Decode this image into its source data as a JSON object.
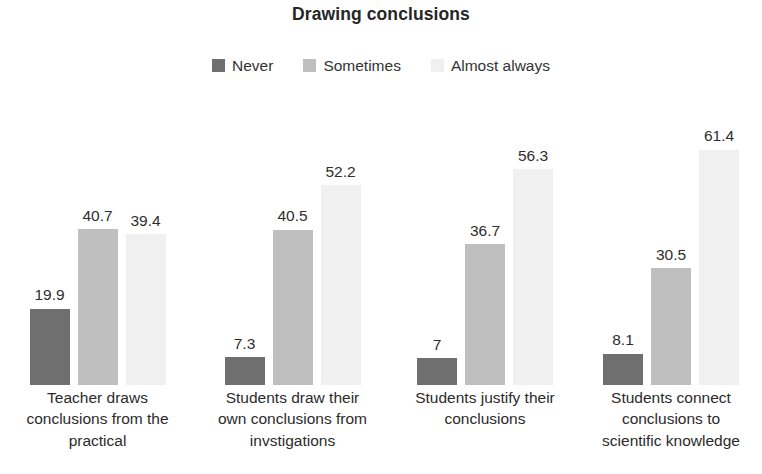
{
  "chart_data": {
    "type": "bar",
    "title": "Drawing conclusions",
    "xlabel": "",
    "ylabel": "",
    "ylim": [
      0,
      70
    ],
    "grid": false,
    "legend_position": "top-center",
    "categories": [
      "Teacher draws conclusions from the practical",
      "Students draw their own conclusions from invstigations",
      "Students justify their conclusions",
      "Students connect conclusions to scientific knowledge"
    ],
    "category_lines": [
      [
        "Teacher draws",
        "conclusions from the",
        "practical"
      ],
      [
        "Students draw their",
        "own conclusions from",
        "invstigations"
      ],
      [
        "Students justify their",
        "conclusions"
      ],
      [
        "Students connect",
        "conclusions to",
        "scientific knowledge"
      ]
    ],
    "series": [
      {
        "name": "Never",
        "color": "#6f6f6f",
        "values": [
          19.9,
          7.3,
          7,
          8.1
        ],
        "labels": [
          "19.9",
          "7.3",
          "7",
          "8.1"
        ]
      },
      {
        "name": "Sometimes",
        "color": "#bfbfbf",
        "values": [
          40.7,
          40.5,
          36.7,
          30.5
        ],
        "labels": [
          "40.7",
          "40.5",
          "36.7",
          "30.5"
        ]
      },
      {
        "name": "Almost always",
        "color": "#f0f0f0",
        "values": [
          39.4,
          52.2,
          56.3,
          61.4
        ],
        "labels": [
          "39.4",
          "52.2",
          "56.3",
          "61.4"
        ]
      }
    ]
  },
  "legend": {
    "items": [
      {
        "label": "Never",
        "color": "#6f6f6f"
      },
      {
        "label": "Sometimes",
        "color": "#bfbfbf"
      },
      {
        "label": "Almost always",
        "color": "#f0f0f0"
      }
    ]
  },
  "title": "Drawing conclusions"
}
